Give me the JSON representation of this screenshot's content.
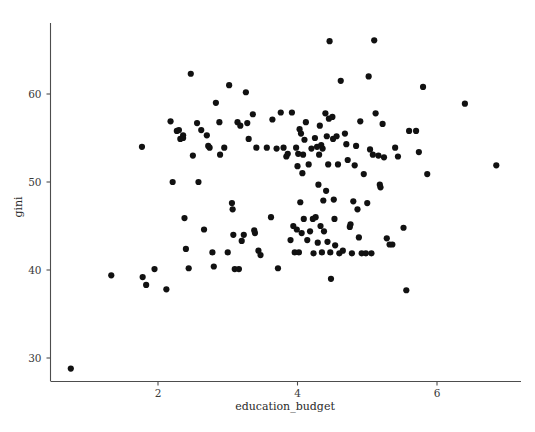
{
  "chart_data": {
    "type": "scatter",
    "title": "",
    "xlabel": "education_budget",
    "ylabel": "gini",
    "xlim": [
      0.45,
      7.2
    ],
    "ylim": [
      27.6,
      66.8
    ],
    "xticks": [
      2,
      4,
      6
    ],
    "xtick_labels": [
      "2",
      "4",
      "6"
    ],
    "yticks": [
      30,
      40,
      50,
      60
    ],
    "ytick_labels": [
      "30",
      "40",
      "50",
      "60"
    ],
    "grid": false,
    "legend": null,
    "marker": {
      "shape": "circle",
      "color": "#111111",
      "size": 3.1
    },
    "n_points": 176,
    "points": [
      [
        0.75,
        28.8
      ],
      [
        1.33,
        39.4
      ],
      [
        1.77,
        54.0
      ],
      [
        1.78,
        39.2
      ],
      [
        1.83,
        38.3
      ],
      [
        1.95,
        40.1
      ],
      [
        2.12,
        37.8
      ],
      [
        2.18,
        56.9
      ],
      [
        2.21,
        50.0
      ],
      [
        2.27,
        55.8
      ],
      [
        2.3,
        55.9
      ],
      [
        2.32,
        54.9
      ],
      [
        2.36,
        55.3
      ],
      [
        2.36,
        55.0
      ],
      [
        2.38,
        45.9
      ],
      [
        2.4,
        42.4
      ],
      [
        2.44,
        40.2
      ],
      [
        2.47,
        62.3
      ],
      [
        2.5,
        53.0
      ],
      [
        2.56,
        56.7
      ],
      [
        2.58,
        50.0
      ],
      [
        2.62,
        55.9
      ],
      [
        2.66,
        44.6
      ],
      [
        2.7,
        55.3
      ],
      [
        2.72,
        54.1
      ],
      [
        2.74,
        53.9
      ],
      [
        2.78,
        42.0
      ],
      [
        2.8,
        40.4
      ],
      [
        2.83,
        59.0
      ],
      [
        2.88,
        56.8
      ],
      [
        2.89,
        53.1
      ],
      [
        2.95,
        53.9
      ],
      [
        3.0,
        42.0
      ],
      [
        3.02,
        61.0
      ],
      [
        3.06,
        47.6
      ],
      [
        3.07,
        46.9
      ],
      [
        3.08,
        44.0
      ],
      [
        3.1,
        40.1
      ],
      [
        3.14,
        56.8
      ],
      [
        3.16,
        40.1
      ],
      [
        3.18,
        56.4
      ],
      [
        3.2,
        43.3
      ],
      [
        3.23,
        44.0
      ],
      [
        3.26,
        60.2
      ],
      [
        3.28,
        56.7
      ],
      [
        3.3,
        54.9
      ],
      [
        3.36,
        57.7
      ],
      [
        3.38,
        44.5
      ],
      [
        3.39,
        44.2
      ],
      [
        3.41,
        53.9
      ],
      [
        3.44,
        42.2
      ],
      [
        3.47,
        41.7
      ],
      [
        3.56,
        53.9
      ],
      [
        3.62,
        46.0
      ],
      [
        3.64,
        57.1
      ],
      [
        3.7,
        53.8
      ],
      [
        3.72,
        40.2
      ],
      [
        3.76,
        57.9
      ],
      [
        3.8,
        53.9
      ],
      [
        3.84,
        52.9
      ],
      [
        3.86,
        53.2
      ],
      [
        3.9,
        43.4
      ],
      [
        3.92,
        57.9
      ],
      [
        3.94,
        45.0
      ],
      [
        3.96,
        42.0
      ],
      [
        3.98,
        53.9
      ],
      [
        3.99,
        44.6
      ],
      [
        4.0,
        51.8
      ],
      [
        4.01,
        53.2
      ],
      [
        4.02,
        42.0
      ],
      [
        4.03,
        56.0
      ],
      [
        4.04,
        47.7
      ],
      [
        4.05,
        55.5
      ],
      [
        4.06,
        44.2
      ],
      [
        4.07,
        51.0
      ],
      [
        4.08,
        53.1
      ],
      [
        4.09,
        45.8
      ],
      [
        4.1,
        54.8
      ],
      [
        4.12,
        56.8
      ],
      [
        4.14,
        43.4
      ],
      [
        4.16,
        52.0
      ],
      [
        4.18,
        44.4
      ],
      [
        4.2,
        53.8
      ],
      [
        4.22,
        45.8
      ],
      [
        4.23,
        41.9
      ],
      [
        4.25,
        55.0
      ],
      [
        4.26,
        46.0
      ],
      [
        4.28,
        54.0
      ],
      [
        4.29,
        43.1
      ],
      [
        4.3,
        49.7
      ],
      [
        4.31,
        53.1
      ],
      [
        4.32,
        56.4
      ],
      [
        4.33,
        45.0
      ],
      [
        4.34,
        54.2
      ],
      [
        4.35,
        42.0
      ],
      [
        4.36,
        53.8
      ],
      [
        4.37,
        47.9
      ],
      [
        4.38,
        44.4
      ],
      [
        4.4,
        57.8
      ],
      [
        4.41,
        49.0
      ],
      [
        4.42,
        55.2
      ],
      [
        4.43,
        43.2
      ],
      [
        4.44,
        52.0
      ],
      [
        4.45,
        57.2
      ],
      [
        4.46,
        66.0
      ],
      [
        4.47,
        42.0
      ],
      [
        4.48,
        39.0
      ],
      [
        4.5,
        57.4
      ],
      [
        4.51,
        54.9
      ],
      [
        4.52,
        48.0
      ],
      [
        4.53,
        45.8
      ],
      [
        4.54,
        42.8
      ],
      [
        4.56,
        55.2
      ],
      [
        4.58,
        52.0
      ],
      [
        4.6,
        41.9
      ],
      [
        4.62,
        61.5
      ],
      [
        4.65,
        42.2
      ],
      [
        4.68,
        55.5
      ],
      [
        4.7,
        54.3
      ],
      [
        4.72,
        52.5
      ],
      [
        4.75,
        44.9
      ],
      [
        4.76,
        45.2
      ],
      [
        4.78,
        41.9
      ],
      [
        4.8,
        47.8
      ],
      [
        4.82,
        51.9
      ],
      [
        4.84,
        54.1
      ],
      [
        4.86,
        46.9
      ],
      [
        4.88,
        43.7
      ],
      [
        4.9,
        56.9
      ],
      [
        4.92,
        41.9
      ],
      [
        4.95,
        50.9
      ],
      [
        4.98,
        41.9
      ],
      [
        5.0,
        47.6
      ],
      [
        5.02,
        62.0
      ],
      [
        5.04,
        53.7
      ],
      [
        5.06,
        41.9
      ],
      [
        5.08,
        53.1
      ],
      [
        5.1,
        66.1
      ],
      [
        5.12,
        57.8
      ],
      [
        5.16,
        53.0
      ],
      [
        5.18,
        49.7
      ],
      [
        5.19,
        49.4
      ],
      [
        5.22,
        56.6
      ],
      [
        5.24,
        52.8
      ],
      [
        5.28,
        43.6
      ],
      [
        5.32,
        42.9
      ],
      [
        5.36,
        42.9
      ],
      [
        5.4,
        53.9
      ],
      [
        5.44,
        52.9
      ],
      [
        5.52,
        44.8
      ],
      [
        5.56,
        37.7
      ],
      [
        5.6,
        55.8
      ],
      [
        5.7,
        55.8
      ],
      [
        5.74,
        53.4
      ],
      [
        5.8,
        60.8
      ],
      [
        5.86,
        50.9
      ],
      [
        6.4,
        58.9
      ],
      [
        6.85,
        51.9
      ]
    ]
  },
  "axes": {
    "x_title": "education_budget",
    "y_title": "gini"
  },
  "icons": {
    "tick_mark": "tick-icon"
  }
}
